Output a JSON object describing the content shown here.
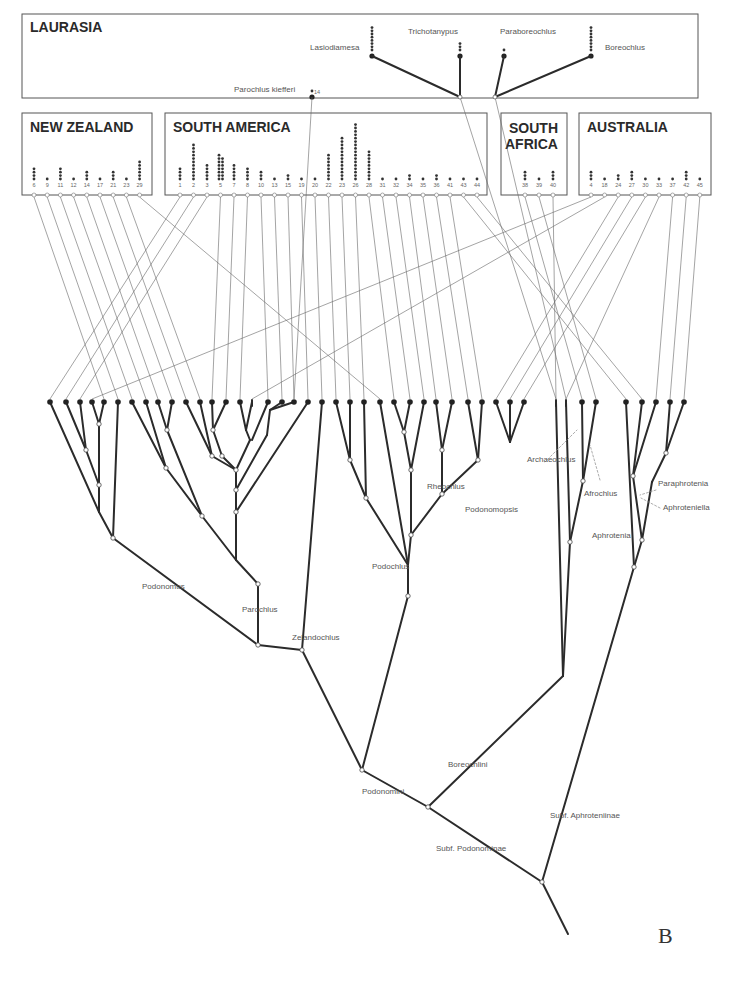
{
  "figure": {
    "panel_label": "B",
    "regions": [
      {
        "id": "laurasia",
        "title": "LAURASIA",
        "x": 22,
        "y": 14,
        "w": 676,
        "h": 84
      },
      {
        "id": "new-zealand",
        "title": "NEW ZEALAND",
        "x": 22,
        "y": 113,
        "w": 130,
        "h": 82
      },
      {
        "id": "south-america",
        "title": "SOUTH AMERICA",
        "x": 165,
        "y": 113,
        "w": 322,
        "h": 82
      },
      {
        "id": "south-africa",
        "title": "SOUTH AFRICA",
        "x": 501,
        "y": 113,
        "w": 66,
        "h": 82
      },
      {
        "id": "australia",
        "title": "AUSTRALIA",
        "x": 579,
        "y": 113,
        "w": 132,
        "h": 82
      }
    ],
    "laurasia_taxa": [
      {
        "name": "Lasiodiamesa",
        "x": 372,
        "y": 56,
        "dots": 8,
        "label_x": 310,
        "label_y": 50
      },
      {
        "name": "Trichotanypus",
        "x": 460,
        "y": 56,
        "dots": 3,
        "label_x": 408,
        "label_y": 34
      },
      {
        "name": "Paraboreochlus",
        "x": 504,
        "y": 56,
        "dots": 1,
        "label_x": 500,
        "label_y": 34
      },
      {
        "name": "Boreochlus",
        "x": 591,
        "y": 56,
        "dots": 8,
        "label_x": 605,
        "label_y": 50
      },
      {
        "name": "Parochlus kiefferi",
        "x": 312,
        "y": 97,
        "dots": 1,
        "label_x": 234,
        "label_y": 92,
        "num": "14"
      }
    ],
    "new_zealand_areas": [
      {
        "num": "6",
        "dots": 4
      },
      {
        "num": "9",
        "dots": 1
      },
      {
        "num": "11",
        "dots": 4
      },
      {
        "num": "12",
        "dots": 1
      },
      {
        "num": "14",
        "dots": 3
      },
      {
        "num": "17",
        "dots": 1
      },
      {
        "num": "21",
        "dots": 3
      },
      {
        "num": "23",
        "dots": 1
      },
      {
        "num": "29",
        "dots": 6
      }
    ],
    "south_america_areas": [
      {
        "num": "1",
        "dots": 4
      },
      {
        "num": "2",
        "dots": 11
      },
      {
        "num": "3",
        "dots": 5
      },
      {
        "num": "5",
        "dots": 15
      },
      {
        "num": "7",
        "dots": 5
      },
      {
        "num": "8",
        "dots": 4
      },
      {
        "num": "10",
        "dots": 3
      },
      {
        "num": "13",
        "dots": 1
      },
      {
        "num": "15",
        "dots": 2
      },
      {
        "num": "19",
        "dots": 1
      },
      {
        "num": "20",
        "dots": 1
      },
      {
        "num": "22",
        "dots": 8
      },
      {
        "num": "23",
        "dots": 13
      },
      {
        "num": "26",
        "dots": 17
      },
      {
        "num": "28",
        "dots": 9
      },
      {
        "num": "31",
        "dots": 1
      },
      {
        "num": "32",
        "dots": 1
      },
      {
        "num": "34",
        "dots": 2
      },
      {
        "num": "35",
        "dots": 1
      },
      {
        "num": "36",
        "dots": 2
      },
      {
        "num": "41",
        "dots": 1
      },
      {
        "num": "43",
        "dots": 1
      },
      {
        "num": "44",
        "dots": 1
      }
    ],
    "south_africa_areas": [
      {
        "num": "38",
        "dots": 3
      },
      {
        "num": "39",
        "dots": 1
      },
      {
        "num": "40",
        "dots": 3
      }
    ],
    "australia_areas": [
      {
        "num": "4",
        "dots": 3
      },
      {
        "num": "18",
        "dots": 1
      },
      {
        "num": "24",
        "dots": 2
      },
      {
        "num": "27",
        "dots": 3
      },
      {
        "num": "30",
        "dots": 1
      },
      {
        "num": "33",
        "dots": 1
      },
      {
        "num": "37",
        "dots": 1
      },
      {
        "num": "42",
        "dots": 3
      },
      {
        "num": "45",
        "dots": 1
      }
    ],
    "clade_labels": [
      {
        "name": "Podonomus",
        "x": 142,
        "y": 589
      },
      {
        "name": "Parochlus",
        "x": 242,
        "y": 612
      },
      {
        "name": "Zelandochlus",
        "x": 292,
        "y": 640
      },
      {
        "name": "Rheochlus",
        "x": 427,
        "y": 489
      },
      {
        "name": "Podonomopsis",
        "x": 465,
        "y": 512
      },
      {
        "name": "Podochlus",
        "x": 372,
        "y": 569
      },
      {
        "name": "Archaeochlus",
        "x": 527,
        "y": 462
      },
      {
        "name": "Afrochlus",
        "x": 584,
        "y": 496
      },
      {
        "name": "Parochlus"
      },
      {
        "name": "Paraphrotenia",
        "x": 658,
        "y": 486
      },
      {
        "name": "Aphroteniella",
        "x": 663,
        "y": 510
      },
      {
        "name": "Aphrotenia",
        "x": 592,
        "y": 538
      },
      {
        "name": "Boreochlini",
        "x": 448,
        "y": 767
      },
      {
        "name": "Podonomini",
        "x": 362,
        "y": 794
      },
      {
        "name": "Subf. Podonominae",
        "x": 436,
        "y": 851
      },
      {
        "name": "Subf. Aphroteniinae",
        "x": 550,
        "y": 818
      }
    ]
  }
}
